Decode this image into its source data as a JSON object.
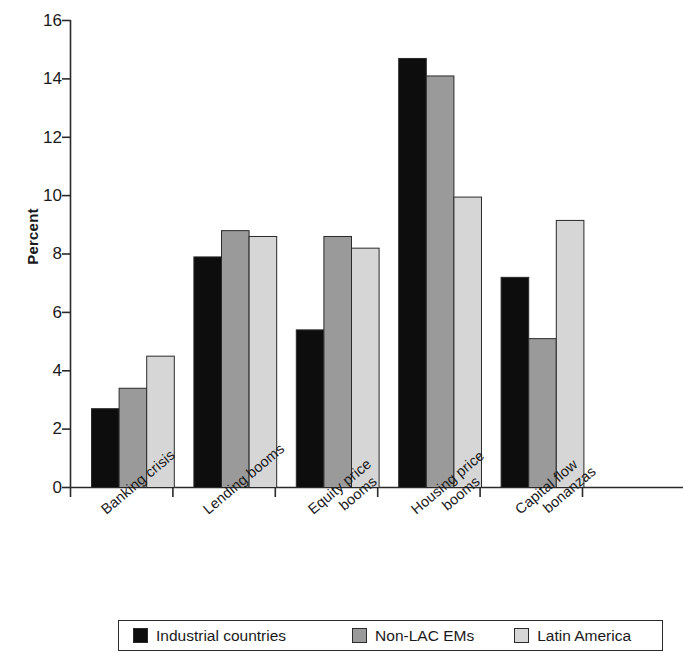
{
  "chart_data": {
    "type": "bar",
    "title": "",
    "xlabel": "",
    "ylabel": "Percent",
    "ylim": [
      0,
      16
    ],
    "yticks": [
      0,
      2,
      4,
      6,
      8,
      10,
      12,
      14,
      16
    ],
    "grid": false,
    "legend_position": "bottom",
    "categories": [
      "Banking crisis",
      "Lending booms",
      "Equity price booms",
      "Housing price booms",
      "Capital flow bonanzas"
    ],
    "category_lines": [
      [
        "Banking crisis"
      ],
      [
        "Lending booms"
      ],
      [
        "Equity price",
        "booms"
      ],
      [
        "Housing price",
        "booms"
      ],
      [
        "Capital flow",
        "bonanzas"
      ]
    ],
    "series": [
      {
        "name": "Industrial countries",
        "color": "#0d0d0d",
        "values": [
          2.7,
          7.9,
          5.4,
          14.7,
          7.2
        ]
      },
      {
        "name": "Non-LAC EMs",
        "color": "#9a9a9a",
        "values": [
          3.4,
          8.8,
          8.6,
          14.1,
          5.1
        ]
      },
      {
        "name": "Latin America",
        "color": "#d6d6d6",
        "values": [
          4.5,
          8.6,
          8.2,
          9.95,
          9.15
        ]
      }
    ]
  },
  "axis": {
    "y_title": "Percent",
    "tick_16": "16",
    "tick_14": "14",
    "tick_12": "12",
    "tick_10": "10",
    "tick_8": "8",
    "tick_6": "6",
    "tick_4": "4",
    "tick_2": "2",
    "tick_0": "0"
  },
  "x_labels": {
    "g1_l1": "Banking crisis",
    "g1_l2": "",
    "g2_l1": "Lending booms",
    "g2_l2": "",
    "g3_l1": "Equity price",
    "g3_l2": "booms",
    "g4_l1": "Housing price",
    "g4_l2": "booms",
    "g5_l1": "Capital flow",
    "g5_l2": "bonanzas"
  },
  "legend": {
    "item1": "Industrial countries",
    "item2": "Non-LAC EMs",
    "item3": "Latin America",
    "color1": "#0d0d0d",
    "color2": "#9a9a9a",
    "color3": "#d6d6d6"
  }
}
